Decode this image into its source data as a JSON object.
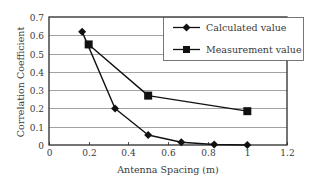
{
  "chart_data": {
    "type": "line",
    "title": "",
    "xlabel": "Antenna Spacing (m)",
    "ylabel": "Correlation Coefficient",
    "xlim": [
      0,
      1.2
    ],
    "ylim": [
      0,
      0.7
    ],
    "xticks": [
      0,
      0.2,
      0.4,
      0.6,
      0.8,
      1,
      1.2
    ],
    "xtick_labels": [
      "0",
      "0.2",
      "0.4",
      "0.6",
      "0.8",
      "1",
      "1.2"
    ],
    "yticks": [
      0,
      0.1,
      0.2,
      0.3,
      0.4,
      0.5,
      0.6,
      0.7
    ],
    "ytick_labels": [
      "0",
      "0.1",
      "0.2",
      "0.3",
      "0.4",
      "0.5",
      "0.6",
      "0.7"
    ],
    "grid": "horizontal",
    "legend_position": "upper right (inside)",
    "series": [
      {
        "name": "Calculated value",
        "marker": "diamond",
        "color": "#111111",
        "x": [
          0.167,
          0.333,
          0.5,
          0.667,
          0.833,
          1.0
        ],
        "y": [
          0.62,
          0.2,
          0.055,
          0.015,
          0.003,
          0.0
        ]
      },
      {
        "name": "Measurement value",
        "marker": "square",
        "color": "#111111",
        "x": [
          0.2,
          0.5,
          1.0
        ],
        "y": [
          0.55,
          0.27,
          0.185
        ]
      }
    ]
  },
  "colors": {
    "line": "#111111",
    "grid": "#8a8a8a",
    "frame": "#2a2a2a",
    "text": "#3a3a3a",
    "background": "#ffffff"
  }
}
